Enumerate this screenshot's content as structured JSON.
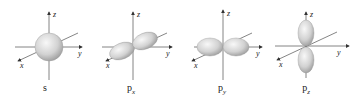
{
  "figure": {
    "panels": [
      {
        "id": "s",
        "label": "s",
        "sub": "",
        "axes": [
          "z",
          "y",
          "x"
        ]
      },
      {
        "id": "px",
        "label": "p",
        "sub": "x",
        "axes": [
          "z",
          "y",
          "x"
        ]
      },
      {
        "id": "py",
        "label": "p",
        "sub": "y",
        "axes": [
          "z",
          "y",
          "x"
        ]
      },
      {
        "id": "pz",
        "label": "p",
        "sub": "z",
        "axes": [
          "z",
          "y",
          "x"
        ]
      }
    ],
    "colors": {
      "axis": "#555555",
      "lobe_light": "#f4f4f4",
      "lobe_dark": "#9a9a9a",
      "text": "#222222"
    }
  }
}
